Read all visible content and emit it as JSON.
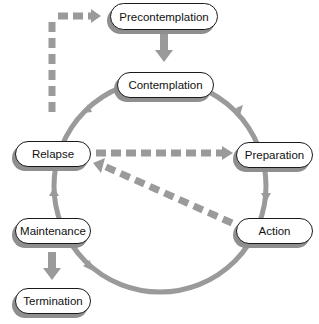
{
  "diagram": {
    "colors": {
      "arrow": "#9a9a9a",
      "node_border": "#1a1a1a",
      "node_fill": "#ffffff",
      "node_shadow": "#8f8f8f",
      "text": "#111111"
    },
    "nodes": {
      "precontemplation": "Precontemplation",
      "contemplation": "Contemplation",
      "preparation": "Preparation",
      "action": "Action",
      "maintenance": "Maintenance",
      "relapse": "Relapse",
      "termination": "Termination"
    },
    "edges": [
      {
        "from": "Precontemplation",
        "to": "Contemplation",
        "style": "solid"
      },
      {
        "from": "Contemplation",
        "to": "Preparation",
        "style": "solid-cycle"
      },
      {
        "from": "Preparation",
        "to": "Action",
        "style": "solid-cycle"
      },
      {
        "from": "Action",
        "to": "Maintenance",
        "style": "solid-cycle"
      },
      {
        "from": "Maintenance",
        "to": "Relapse",
        "style": "solid-cycle"
      },
      {
        "from": "Relapse",
        "to": "Contemplation",
        "style": "solid-cycle"
      },
      {
        "from": "Maintenance",
        "to": "Termination",
        "style": "solid"
      },
      {
        "from": "Relapse",
        "to": "Precontemplation",
        "style": "dashed"
      },
      {
        "from": "Relapse",
        "to": "Preparation",
        "style": "dashed"
      },
      {
        "from": "Action",
        "to": "Relapse",
        "style": "dashed"
      }
    ]
  }
}
